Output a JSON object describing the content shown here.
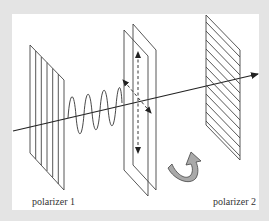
{
  "figure": {
    "labels": {
      "polarizer_1": "polarizer 1",
      "polarizer_2": "polarizer 2"
    },
    "elements": [
      {
        "name": "polarizer-1",
        "type": "vertical-line-grating",
        "line_count": 7
      },
      {
        "name": "light-wave",
        "type": "sinusoid",
        "peaks": 4
      },
      {
        "name": "rotator-plates",
        "type": "double-plate",
        "arrows": [
          "vertical-dashed",
          "diagonal-dashed"
        ]
      },
      {
        "name": "polarizer-2",
        "type": "diagonal-line-grating"
      },
      {
        "name": "rotation-arrow",
        "type": "curved-arrow",
        "fill": "#a9a9a9"
      },
      {
        "name": "propagation-axis",
        "type": "arrow"
      }
    ],
    "colors": {
      "background": "#e4e4e4",
      "panel": "#ffffff",
      "stroke": "#333333",
      "rotation_arrow_fill": "#a9a9a9"
    }
  }
}
